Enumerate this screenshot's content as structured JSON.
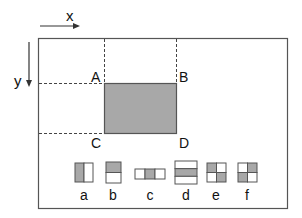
{
  "axes": {
    "x_label": "x",
    "y_label": "y"
  },
  "corners": {
    "a": "A",
    "b": "B",
    "c": "C",
    "d": "D"
  },
  "colors": {
    "fill": "#a8a8a8",
    "stroke": "#555555",
    "background": "#ffffff"
  },
  "patterns": [
    {
      "label": "a",
      "layout": "2 columns",
      "shaded": [
        1,
        0
      ]
    },
    {
      "label": "b",
      "layout": "2 rows",
      "shaded": [
        1,
        0
      ]
    },
    {
      "label": "c",
      "layout": "3 columns",
      "shaded": [
        0,
        1,
        0
      ]
    },
    {
      "label": "d",
      "layout": "3 rows",
      "shaded": [
        0,
        1,
        0
      ]
    },
    {
      "label": "e",
      "layout": "2x2 grid",
      "shaded": [
        1,
        0,
        0,
        1
      ]
    },
    {
      "label": "f",
      "layout": "2x2 grid",
      "shaded": [
        0,
        1,
        1,
        0
      ]
    }
  ]
}
